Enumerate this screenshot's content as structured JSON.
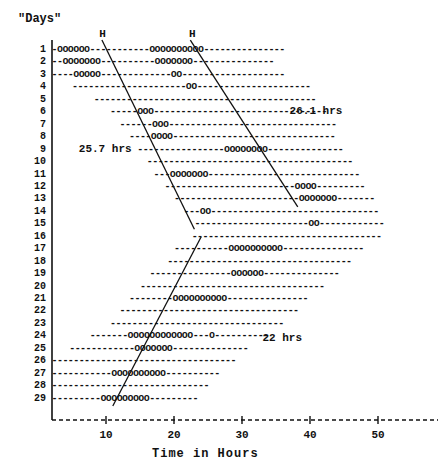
{
  "chart_data": {
    "type": "raster",
    "title": "",
    "ylabel": "\"Days\"",
    "xlabel": "Time in Hours",
    "xlim": [
      2,
      53
    ],
    "xticks": [
      10,
      20,
      30,
      40,
      50
    ],
    "xtick_labels": [
      "10",
      "20",
      "30",
      "40",
      "50"
    ],
    "ylim": [
      1,
      29
    ],
    "ycategories": [
      "1",
      "2",
      "3",
      "4",
      "5",
      "6",
      "7",
      "8",
      "9",
      "10",
      "11",
      "12",
      "13",
      "14",
      "15",
      "16",
      "17",
      "18",
      "19",
      "20",
      "21",
      "22",
      "23",
      "24",
      "25",
      "26",
      "27",
      "28",
      "29"
    ],
    "grid": false,
    "legend": null,
    "marker_sleep": "o",
    "marker_wake": "-",
    "rows": [
      {
        "day": 1,
        "start": 2.0,
        "end": 36.0,
        "sleep": [
          [
            2.6,
            7.6
          ],
          [
            16.0,
            24.0
          ]
        ]
      },
      {
        "day": 2,
        "start": 2.0,
        "end": 35.0,
        "sleep": [
          [
            3.4,
            9.4
          ],
          [
            17.4,
            23.0
          ]
        ]
      },
      {
        "day": 3,
        "start": 2.0,
        "end": 36.6,
        "sleep": [
          [
            5.4,
            9.0
          ],
          [
            19.4,
            21.0
          ]
        ]
      },
      {
        "day": 4,
        "start": 5.0,
        "end": 40.0,
        "sleep": [
          [
            21.6,
            23.4
          ]
        ]
      },
      {
        "day": 5,
        "start": 8.2,
        "end": 41.0,
        "sleep": []
      },
      {
        "day": 6,
        "start": 10.6,
        "end": 43.0,
        "sleep": [
          [
            14.6,
            16.6
          ]
        ]
      },
      {
        "day": 7,
        "start": 12.0,
        "end": 43.6,
        "sleep": [
          [
            16.4,
            19.0
          ]
        ]
      },
      {
        "day": 8,
        "start": 13.4,
        "end": 44.0,
        "sleep": [
          [
            16.6,
            19.4
          ]
        ]
      },
      {
        "day": 9,
        "start": 14.6,
        "end": 45.4,
        "sleep": [
          [
            27.0,
            34.0
          ]
        ]
      },
      {
        "day": 10,
        "start": 16.0,
        "end": 46.4,
        "sleep": []
      },
      {
        "day": 11,
        "start": 17.0,
        "end": 47.0,
        "sleep": [
          [
            19.0,
            25.0
          ]
        ]
      },
      {
        "day": 12,
        "start": 18.6,
        "end": 48.0,
        "sleep": [
          [
            38.0,
            41.0
          ]
        ]
      },
      {
        "day": 13,
        "start": 20.0,
        "end": 49.4,
        "sleep": [
          [
            38.0,
            44.0
          ]
        ]
      },
      {
        "day": 14,
        "start": 21.4,
        "end": 50.0,
        "sleep": [
          [
            23.6,
            25.0
          ]
        ]
      },
      {
        "day": 15,
        "start": 23.0,
        "end": 51.0,
        "sleep": [
          [
            39.6,
            41.6
          ]
        ]
      },
      {
        "day": 16,
        "start": 22.6,
        "end": 50.6,
        "sleep": []
      },
      {
        "day": 17,
        "start": 20.0,
        "end": 48.0,
        "sleep": [
          [
            28.0,
            36.0
          ]
        ]
      },
      {
        "day": 18,
        "start": 19.0,
        "end": 46.0,
        "sleep": []
      },
      {
        "day": 19,
        "start": 16.4,
        "end": 44.0,
        "sleep": [
          [
            28.6,
            33.0
          ]
        ]
      },
      {
        "day": 20,
        "start": 15.0,
        "end": 42.0,
        "sleep": []
      },
      {
        "day": 21,
        "start": 13.4,
        "end": 40.0,
        "sleep": [
          [
            20.0,
            28.0
          ]
        ]
      },
      {
        "day": 22,
        "start": 12.0,
        "end": 38.6,
        "sleep": []
      },
      {
        "day": 23,
        "start": 10.6,
        "end": 36.0,
        "sleep": []
      },
      {
        "day": 24,
        "start": 7.6,
        "end": 34.0,
        "sleep": [
          [
            13.0,
            23.0
          ],
          [
            25.0,
            26.0
          ]
        ]
      },
      {
        "day": 25,
        "start": 4.6,
        "end": 31.4,
        "sleep": [
          [
            14.0,
            20.0
          ]
        ]
      },
      {
        "day": 26,
        "start": 2.0,
        "end": 29.0,
        "sleep": []
      },
      {
        "day": 27,
        "start": 2.0,
        "end": 26.6,
        "sleep": [
          [
            10.6,
            18.6
          ]
        ]
      },
      {
        "day": 28,
        "start": 2.0,
        "end": 25.0,
        "sleep": []
      },
      {
        "day": 29,
        "start": 2.0,
        "end": 23.4,
        "sleep": [
          [
            9.4,
            16.0
          ]
        ]
      }
    ],
    "fit_lines": [
      {
        "label": "25.7 hrs",
        "x1": 9.4,
        "y1": 0.2,
        "x2": 23.0,
        "y2": 15.4
      },
      {
        "label": "26.1 hrs",
        "x1": 22.4,
        "y1": 0.2,
        "x2": 38.2,
        "y2": 13.6
      },
      {
        "label": "22 hrs",
        "x1": 24.0,
        "y1": 16.0,
        "x2": 11.0,
        "y2": 29.6
      }
    ],
    "h_markers": [
      {
        "label": "H",
        "x": 9.6
      },
      {
        "label": "H",
        "x": 22.8
      }
    ],
    "annotations": [
      {
        "text": "26.1 hrs",
        "x": 37.0,
        "y": 6.0
      },
      {
        "text": "25.7 hrs",
        "x": 6.0,
        "y": 9.0
      },
      {
        "text": "22 hrs",
        "x": 33.0,
        "y": 24.2
      }
    ]
  },
  "colors": {
    "ink": "#111111",
    "background": "#ffffff",
    "line": "#1a1a1a"
  }
}
